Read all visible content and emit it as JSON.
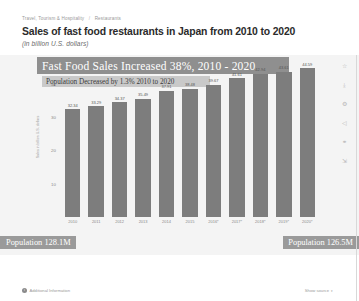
{
  "header": {
    "breadcrumb": [
      "Travel, Tourism & Hospitality",
      "Restaurants"
    ],
    "title": "Sales of fast food restaurants in Japan from 2010 to 2020",
    "subtitle": "(in billion U.S. dollars)"
  },
  "annotations": {
    "banner_main": "Fast Food Sales Increased 38%, 2010 - 2020",
    "banner_sub": "Population Decreased by 1.3% 2010 to 2020",
    "population_left": "Population 128.1M",
    "population_right": "Population 126.5M"
  },
  "rail": {
    "icons": [
      "star-icon",
      "download-icon",
      "settings-icon",
      "share-icon",
      "link-icon",
      "expand-icon"
    ],
    "glyphs": [
      "☆",
      "⤓",
      "⚙",
      "◁",
      "⚭",
      "⇲"
    ]
  },
  "footer": {
    "info_glyph": "i",
    "additional_information": "Additional Information",
    "show_source": "Show source",
    "caret": "▾"
  },
  "chart_data": {
    "type": "bar",
    "title": "Sales of fast food restaurants in Japan from 2010 to 2020",
    "xlabel": "",
    "ylabel": "Sales in billion U.S. dollars",
    "categories": [
      "2010",
      "2011",
      "2012",
      "2013",
      "2014",
      "2015",
      "2016*",
      "2017*",
      "2018*",
      "2019*",
      "2020*"
    ],
    "values": [
      32.34,
      33.29,
      34.37,
      35.49,
      37.91,
      38.48,
      39.67,
      41.61,
      42.94,
      43.61,
      44.59
    ],
    "value_labels": [
      "32.34",
      "33.29",
      "34.37",
      "35.49",
      "37.91",
      "38.48",
      "39.67",
      "41.61",
      "42.94",
      "43.61",
      "44.59"
    ],
    "ylim": [
      0,
      48
    ],
    "yticks": [
      40,
      30,
      20,
      10
    ],
    "ytick_labels": [
      "40",
      "30",
      "20",
      "10"
    ],
    "grid": false,
    "legend": "none",
    "bar_color": "#7d7d7d"
  }
}
